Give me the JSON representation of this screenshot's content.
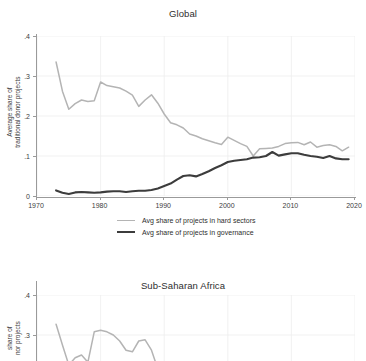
{
  "figure": {
    "panels": [
      {
        "id": "global",
        "title": "Global",
        "ylabel_line1": "Average share of",
        "ylabel_line2": "traditional donor projects"
      },
      {
        "id": "ssa",
        "title": "Sub-Saharan Africa",
        "ylabel_line1": "share of",
        "ylabel_line2": "nor projects"
      }
    ],
    "legend": {
      "items": [
        {
          "label": "Avg share of projects in hard sectors",
          "color": "#b4b4b4",
          "key": "hard"
        },
        {
          "label": "Avg share of projects in governance",
          "color": "#3c3c3c",
          "key": "gov"
        }
      ]
    },
    "axis": {
      "x_ticks": [
        "1970",
        "1980",
        "1990",
        "2000",
        "2010",
        "2020"
      ],
      "y_ticks_global": [
        "0",
        ".1",
        ".2",
        ".3",
        ".4"
      ],
      "y_ticks_ssa": [
        ".4",
        ".3"
      ]
    },
    "colors": {
      "hard_sectors": "#b4b4b4",
      "governance": "#3c3c3c",
      "axis": "#9a9a9a",
      "grid": "#ededed",
      "text": "#2e2e2e",
      "background": "#ffffff"
    }
  },
  "chart_data": [
    {
      "type": "line",
      "title": "Global",
      "xlabel": "",
      "ylabel": "Average share of traditional donor projects",
      "xlim": [
        1970,
        2020
      ],
      "ylim": [
        0,
        0.4
      ],
      "xticks": [
        1970,
        1980,
        1990,
        2000,
        2010,
        2020
      ],
      "yticks": [
        0,
        0.1,
        0.2,
        0.3,
        0.4
      ],
      "grid": true,
      "legend_position": "below",
      "x": [
        1973,
        1974,
        1975,
        1976,
        1977,
        1978,
        1979,
        1980,
        1981,
        1982,
        1983,
        1984,
        1985,
        1986,
        1987,
        1988,
        1989,
        1990,
        1991,
        1992,
        1993,
        1994,
        1995,
        1996,
        1997,
        1998,
        1999,
        2000,
        2001,
        2002,
        2003,
        2004,
        2005,
        2006,
        2007,
        2008,
        2009,
        2010,
        2011,
        2012,
        2013,
        2014,
        2015,
        2016,
        2017,
        2018,
        2019
      ],
      "series": [
        {
          "name": "Avg share of projects in hard sectors",
          "color": "#b4b4b4",
          "values": [
            0.335,
            0.262,
            0.217,
            0.231,
            0.24,
            0.236,
            0.238,
            0.285,
            0.276,
            0.273,
            0.27,
            0.262,
            0.252,
            0.224,
            0.24,
            0.253,
            0.232,
            0.205,
            0.183,
            0.178,
            0.17,
            0.155,
            0.15,
            0.143,
            0.138,
            0.133,
            0.129,
            0.147,
            0.139,
            0.131,
            0.124,
            0.1,
            0.118,
            0.119,
            0.12,
            0.124,
            0.131,
            0.133,
            0.134,
            0.128,
            0.135,
            0.122,
            0.126,
            0.128,
            0.124,
            0.113,
            0.122
          ]
        },
        {
          "name": "Avg share of projects in governance",
          "color": "#3c3c3c",
          "values": [
            0.014,
            0.008,
            0.005,
            0.009,
            0.01,
            0.009,
            0.008,
            0.009,
            0.011,
            0.012,
            0.012,
            0.01,
            0.012,
            0.013,
            0.013,
            0.015,
            0.019,
            0.025,
            0.031,
            0.041,
            0.05,
            0.052,
            0.049,
            0.055,
            0.062,
            0.07,
            0.077,
            0.085,
            0.088,
            0.09,
            0.092,
            0.096,
            0.097,
            0.1,
            0.11,
            0.101,
            0.104,
            0.107,
            0.107,
            0.103,
            0.1,
            0.098,
            0.095,
            0.1,
            0.094,
            0.092,
            0.092
          ]
        }
      ]
    },
    {
      "type": "line",
      "title": "Sub-Saharan Africa",
      "xlabel": "",
      "ylabel": "share of nor projects",
      "xlim": [
        1970,
        2020
      ],
      "ylim": [
        0,
        0.4
      ],
      "yticks": [
        0.4,
        0.3
      ],
      "grid": true,
      "note": "panel cropped at image bottom edge",
      "x": [
        1973,
        1974,
        1975,
        1976,
        1977,
        1978,
        1979,
        1980,
        1981,
        1982,
        1983,
        1984,
        1985,
        1986,
        1987,
        1988,
        1989
      ],
      "series": [
        {
          "name": "Avg share of projects in hard sectors",
          "color": "#b4b4b4",
          "values": [
            0.327,
            0.275,
            0.225,
            0.243,
            0.25,
            0.232,
            0.308,
            0.312,
            0.308,
            0.3,
            0.285,
            0.262,
            0.258,
            0.285,
            0.288,
            0.262,
            0.215
          ]
        }
      ]
    }
  ]
}
